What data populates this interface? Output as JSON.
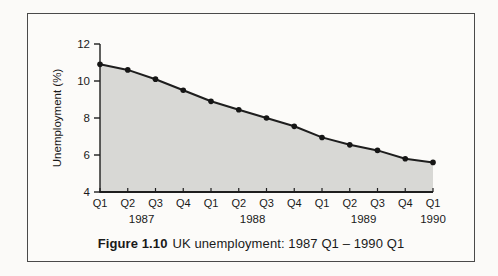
{
  "figure": {
    "caption": {
      "label": "Figure 1.10",
      "text": "UK unemployment: 1987 Q1 – 1990 Q1"
    }
  },
  "colors": {
    "page_background": "#fbfaf8",
    "frame_background": "#fcfbf9",
    "frame_border": "#4a4a4a",
    "area_fill": "#d8d8d5",
    "line": "#1e1e1e",
    "marker": "#161616",
    "axis": "#1e1e1e",
    "text": "#1a1a1a"
  },
  "chart_data": {
    "type": "area",
    "xlabel": "",
    "ylabel": "Unemployment (%)",
    "ylim": [
      4,
      12
    ],
    "yticks": [
      4,
      6,
      8,
      10,
      12
    ],
    "categories": [
      "Q1",
      "Q2",
      "Q3",
      "Q4",
      "Q1",
      "Q2",
      "Q3",
      "Q4",
      "Q1",
      "Q2",
      "Q3",
      "Q4",
      "Q1"
    ],
    "year_labels": [
      {
        "label": "1987",
        "index": 1.5
      },
      {
        "label": "1988",
        "index": 5.5
      },
      {
        "label": "1989",
        "index": 9.5
      },
      {
        "label": "1990",
        "index": 12
      }
    ],
    "series": [
      {
        "name": "UK unemployment rate (%)",
        "values": [
          10.9,
          10.6,
          10.1,
          9.5,
          8.9,
          8.45,
          8.0,
          7.55,
          6.95,
          6.55,
          6.25,
          5.8,
          5.6
        ]
      }
    ],
    "grid": false,
    "legend": "none",
    "marker": "dot"
  }
}
